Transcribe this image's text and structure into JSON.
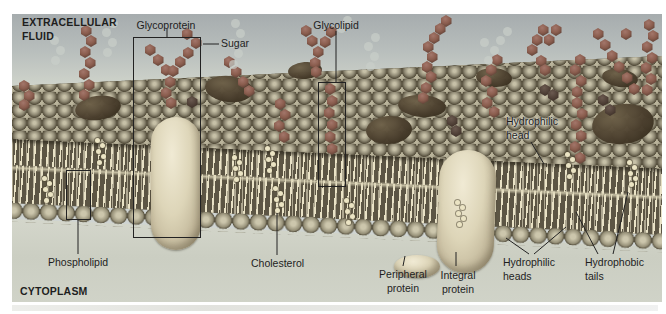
{
  "figure": {
    "regions": {
      "extracellular_line1": "EXTRACELLULAR",
      "extracellular_line2": "FLUID",
      "cytoplasm": "CYTOPLASM"
    },
    "labels": {
      "glycoprotein": "Glycoprotein",
      "sugar": "Sugar",
      "glycolipid": "Glycolipid",
      "hydrophilic_head_line1": "Hydrophilic",
      "hydrophilic_head_line2": "head",
      "phospholipid": "Phospholipid",
      "cholesterol": "Cholesterol",
      "peripheral_line1": "Peripheral",
      "peripheral_line2": "protein",
      "integral_line1": "Integral",
      "integral_line2": "protein",
      "hydrophilic_heads_line1": "Hydrophilic",
      "hydrophilic_heads_line2": "heads",
      "hydrophobic_tails_line1": "Hydrophobic",
      "hydrophobic_tails_line2": "tails"
    },
    "colors": {
      "membrane_head_sphere": "#8e8873",
      "tail_background": "#5a5443",
      "tail_stroke": "#ece5c9",
      "sugar_hexagon": "#8a5d4e",
      "protein_cream": "#ddd5b8",
      "protein_dark": "#46392a",
      "extracellular_fluid": "#b3babb",
      "cytoplasm_fill": "#d5d7cc",
      "outline_and_text": "#222222"
    }
  }
}
